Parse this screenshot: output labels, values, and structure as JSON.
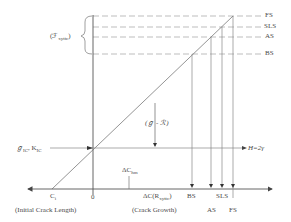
{
  "diagram": {
    "type": "crack-growth-energy-diagram",
    "axes": {
      "x_left_label": "(Initial Crack Length)",
      "x_right_label": "(Crack Growth)",
      "origin_label": "0",
      "initial_crack_label": "C",
      "initial_crack_sub": "i",
      "delta_c_hm_label": "ΔC",
      "delta_c_hm_sub": "hm",
      "delta_c_r_label": "ΔC(R",
      "delta_c_r_sub": "xyttc",
      "delta_c_r_close": ")"
    },
    "left_labels": {
      "gamma_bracket_label": "(ℱ",
      "gamma_bracket_sub": "xyttc",
      "gamma_bracket_close": ")",
      "g_ic_label": "ℊ",
      "g_ic_sub": "IC",
      "k_ic_sep": ", K",
      "k_ic_sub": "IC"
    },
    "middle_labels": {
      "difference_label": "(ℊ - ℛ)",
      "h_label": "H=2γ"
    },
    "right_levels": [
      {
        "id": "FS",
        "label": "FS"
      },
      {
        "id": "SLS",
        "label": "SLS"
      },
      {
        "id": "AS",
        "label": "AS"
      },
      {
        "id": "BS",
        "label": "BS"
      }
    ],
    "bottom_markers": [
      {
        "id": "BS",
        "label": "BS"
      },
      {
        "id": "AS",
        "label": "AS"
      },
      {
        "id": "SLS",
        "label": "SLS"
      },
      {
        "id": "FS",
        "label": "FS"
      }
    ],
    "colors": {
      "line": "#555555",
      "dashed": "#9a9a9a",
      "text": "#4a4a4a"
    }
  }
}
